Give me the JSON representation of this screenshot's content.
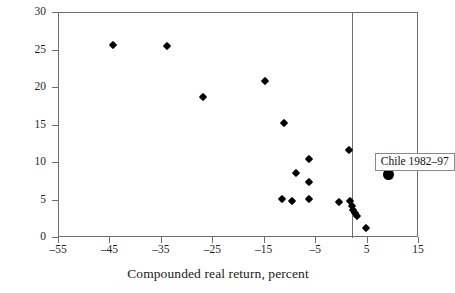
{
  "chart_data": {
    "type": "scatter",
    "title": "",
    "subtitle": "",
    "xlabel": "Compounded real return, percent",
    "ylabel": "",
    "xlim": [
      -55,
      15
    ],
    "ylim": [
      0,
      30
    ],
    "xticks": [
      -55,
      -45,
      -35,
      -25,
      -15,
      -5,
      5,
      15
    ],
    "xtick_labels": [
      "–55",
      "–45",
      "–35",
      "–25",
      "–15",
      "–5",
      "5",
      "15"
    ],
    "yticks": [
      0,
      5,
      10,
      15,
      20,
      25,
      30
    ],
    "ytick_labels": [
      "0",
      "5",
      "10",
      "15",
      "20",
      "25",
      "30"
    ],
    "grid": false,
    "legend": null,
    "reference_lines": [
      {
        "name": "vertical-reference-line",
        "orientation": "vertical",
        "x": 2.0
      }
    ],
    "series": [
      {
        "name": "countries",
        "marker": "diamond",
        "color": "#000000",
        "points": [
          {
            "x": -44.5,
            "y": 25.7
          },
          {
            "x": -34.0,
            "y": 25.6
          },
          {
            "x": -27.0,
            "y": 18.8
          },
          {
            "x": -15.0,
            "y": 21.0
          },
          {
            "x": -11.2,
            "y": 15.4
          },
          {
            "x": -9.0,
            "y": 8.7
          },
          {
            "x": -6.4,
            "y": 10.5
          },
          {
            "x": -6.4,
            "y": 7.5
          },
          {
            "x": -11.6,
            "y": 5.2
          },
          {
            "x": -9.6,
            "y": 5.0
          },
          {
            "x": -6.4,
            "y": 5.2
          },
          {
            "x": 1.4,
            "y": 11.7
          },
          {
            "x": -0.6,
            "y": 4.8
          },
          {
            "x": 1.6,
            "y": 4.9
          },
          {
            "x": 2.0,
            "y": 4.3
          },
          {
            "x": 2.2,
            "y": 3.7
          },
          {
            "x": 2.5,
            "y": 3.3
          },
          {
            "x": 2.9,
            "y": 2.9
          },
          {
            "x": 4.6,
            "y": 1.3
          }
        ]
      },
      {
        "name": "Chile 1982–97",
        "marker": "circle",
        "color": "#000000",
        "points": [
          {
            "x": 9.0,
            "y": 8.5
          }
        ]
      }
    ],
    "annotations": [
      {
        "name": "chile-label",
        "text": "Chile 1982–97",
        "x": 6.4,
        "y": 11.4
      }
    ]
  }
}
